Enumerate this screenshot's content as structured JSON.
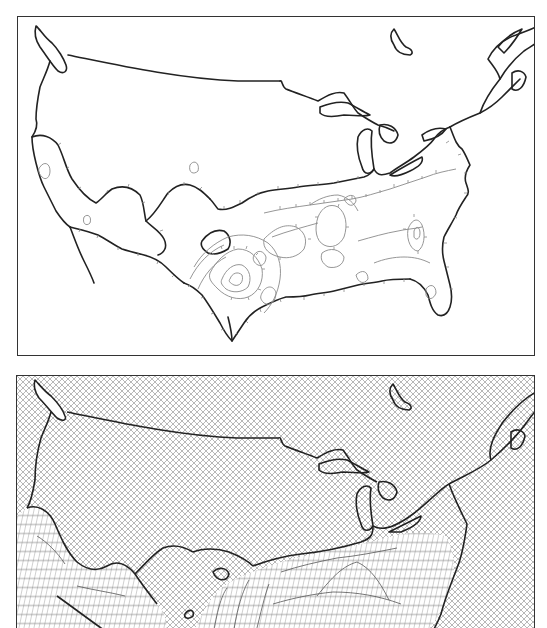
{
  "figure": {
    "panels": [
      {
        "id": "contour",
        "kind": "contour-map",
        "subject": "United States (contiguous) with contour lines over southern and western regions",
        "frame_color": "#333333",
        "coast_color": "#222222",
        "contour_color": "#8a8a8a",
        "background": "#ffffff"
      },
      {
        "id": "mesh",
        "kind": "3d-wireframe-surface-map",
        "subject": "United States (contiguous) with cross-hatched background and raised wireframe surface over southern regions",
        "frame_color": "#333333",
        "coast_color": "#222222",
        "hatch_color": "#9a9a9a",
        "mesh_color": "#6a6a6a",
        "background": "#ffffff"
      }
    ]
  }
}
